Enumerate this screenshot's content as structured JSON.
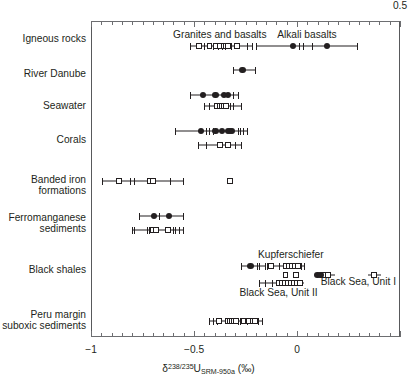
{
  "chart_data": {
    "type": "scatter",
    "title": "",
    "xlabel": "δ238/235U SRM-950a (‰)",
    "xlabel_parts": {
      "delta": "δ",
      "sup": "238/235",
      "element": "U",
      "sub": "SRM-950a",
      "units": "(‰)"
    },
    "ylabel": "",
    "xlim": [
      -1.0,
      0.5
    ],
    "xticks": [
      -1,
      -0.5,
      0,
      0.5
    ],
    "xticklabels": [
      "−1",
      "−0.5",
      "0",
      "0.5"
    ],
    "minor_tick_step": 0.05,
    "grid": false,
    "legend": "none",
    "marker_types": {
      "filled_circle": "measurement (filled circle)",
      "open_square": "measurement (open square)",
      "tick_cap": "individual sample tick"
    },
    "categories": [
      "Igneous rocks",
      "River Danube",
      "Seawater",
      "Corals",
      "Banded iron formations",
      "Ferromanganese sediments",
      "Black shales",
      "Peru margin suboxic sediments"
    ],
    "series": [
      {
        "name": "Igneous rocks — Granites and basalts",
        "category": "Igneous rocks",
        "marker": "open_square",
        "range": [
          -0.52,
          -0.22
        ],
        "squares": [
          -0.475,
          -0.425,
          -0.395,
          -0.375,
          -0.355,
          -0.345,
          -0.335,
          -0.29
        ],
        "ticks": [
          -0.52,
          -0.45,
          -0.41,
          -0.385,
          -0.365,
          -0.35,
          -0.32,
          -0.245,
          -0.22
        ]
      },
      {
        "name": "Igneous rocks — Alkali basalts",
        "category": "Igneous rocks",
        "marker": "filled_circle",
        "range": [
          -0.2,
          0.29
        ],
        "circles": [
          -0.02,
          0.145
        ],
        "ticks": [
          -0.2,
          0.01,
          0.03,
          0.075,
          0.29
        ]
      },
      {
        "name": "River Danube",
        "category": "River Danube",
        "marker": "filled_circle",
        "range": [
          -0.31,
          -0.205
        ],
        "circles": [
          -0.265
        ],
        "ticks": [
          -0.31,
          -0.205
        ]
      },
      {
        "name": "Seawater — filled",
        "category": "Seawater",
        "marker": "filled_circle",
        "range": [
          -0.52,
          -0.285
        ],
        "circles": [
          -0.455,
          -0.395,
          -0.355,
          -0.335
        ],
        "ticks": [
          -0.52,
          -0.31,
          -0.285
        ]
      },
      {
        "name": "Seawater — open",
        "category": "Seawater",
        "marker": "open_square",
        "range": [
          -0.45,
          -0.27
        ],
        "squares": [
          -0.39,
          -0.375,
          -0.365,
          -0.355,
          -0.345
        ],
        "ticks": [
          -0.45,
          -0.425,
          -0.325,
          -0.31,
          -0.27
        ]
      },
      {
        "name": "Corals — filled",
        "category": "Corals",
        "marker": "filled_circle",
        "range": [
          -0.59,
          -0.245
        ],
        "circles": [
          -0.465,
          -0.395,
          -0.365,
          -0.335,
          -0.325,
          -0.315
        ],
        "ticks": [
          -0.59,
          -0.44,
          -0.425,
          -0.41,
          -0.285,
          -0.275,
          -0.26,
          -0.245
        ]
      },
      {
        "name": "Corals — open",
        "category": "Corals",
        "marker": "open_square",
        "range": [
          -0.48,
          -0.27
        ],
        "squares": [
          -0.375,
          -0.335
        ],
        "ticks": [
          -0.48,
          -0.44,
          -0.3,
          -0.27
        ]
      },
      {
        "name": "Banded iron formations",
        "category": "Banded iron formations",
        "marker": "open_square",
        "range": [
          -0.945,
          -0.555
        ],
        "squares": [
          -0.865,
          -0.715,
          -0.7
        ],
        "ticks": [
          -0.945,
          -0.81,
          -0.79,
          -0.615,
          -0.555
        ],
        "outlier_squares": [
          -0.325
        ]
      },
      {
        "name": "Ferromanganese sediments — filled",
        "category": "Ferromanganese sediments",
        "marker": "filled_circle",
        "range": [
          -0.765,
          -0.555
        ],
        "circles": [
          -0.695,
          -0.62
        ],
        "ticks": [
          -0.765,
          -0.67,
          -0.555
        ]
      },
      {
        "name": "Ferromanganese sediments — open",
        "category": "Ferromanganese sediments",
        "marker": "open_square",
        "range": [
          -0.8,
          -0.555
        ],
        "squares": [
          -0.7,
          -0.685,
          -0.625
        ],
        "ticks": [
          -0.8,
          -0.79,
          -0.73,
          -0.72,
          -0.6,
          -0.59,
          -0.575,
          -0.555
        ]
      },
      {
        "name": "Black shales — filled",
        "category": "Black shales",
        "marker": "filled_circle",
        "range": [
          -0.27,
          -0.155
        ],
        "circles": [
          -0.225
        ],
        "ticks": [
          -0.27,
          -0.195,
          -0.185,
          -0.155
        ]
      },
      {
        "name": "Black shales — Kupferschiefer",
        "category": "Black shales",
        "marker": "open_square",
        "range": [
          -0.145,
          0.035
        ],
        "squares": [
          -0.125,
          -0.055,
          -0.04,
          -0.025,
          -0.01,
          0.005
        ],
        "ticks": [
          -0.145,
          -0.085,
          0.02,
          0.035
        ]
      },
      {
        "name": "Black shales — middle row",
        "category": "Black shales",
        "marker": "open_square",
        "squares": [
          -0.055,
          -0.005,
          0.125,
          0.15,
          0.375
        ],
        "circles": [
          0.1,
          0.115
        ],
        "segments": [
          [
            0.09,
            0.185
          ],
          [
            0.345,
            0.41
          ]
        ]
      },
      {
        "name": "Black shales — Black Sea Unit II",
        "category": "Black shales",
        "marker": "open_square",
        "range": [
          -0.185,
          0.035
        ],
        "squares": [
          -0.09,
          -0.075,
          -0.06,
          -0.045,
          -0.03,
          -0.015,
          0.0,
          0.015
        ],
        "ticks": [
          -0.185,
          -0.155,
          -0.12
        ]
      },
      {
        "name": "Peru margin suboxic sediments",
        "category": "Peru margin suboxic sediments",
        "marker": "open_square",
        "range": [
          -0.425,
          -0.17
        ],
        "squares": [
          -0.38,
          -0.335,
          -0.325,
          -0.315,
          -0.305,
          -0.295,
          -0.26,
          -0.235,
          -0.215,
          -0.205
        ],
        "ticks": [
          -0.425,
          -0.41,
          -0.39,
          -0.285,
          -0.275,
          -0.245,
          -0.19,
          -0.17
        ]
      }
    ],
    "annotations": [
      {
        "text": "Granites and basalts",
        "x": -0.375,
        "category": "Igneous rocks",
        "position": "above"
      },
      {
        "text": "Alkali basalts",
        "x": 0.045,
        "category": "Igneous rocks",
        "position": "above"
      },
      {
        "text": "Kupferschiefer",
        "x": -0.03,
        "category": "Black shales",
        "position": "above"
      },
      {
        "text": "Black Sea, Unit I",
        "x": 0.21,
        "category": "Black shales",
        "position": "right"
      },
      {
        "text": "Black Sea, Unit II",
        "x": -0.09,
        "category": "Black shales",
        "position": "below"
      }
    ]
  },
  "axis": {
    "ylabels": [
      "Igneous rocks",
      "River Danube",
      "Seawater",
      "Corals",
      "Banded iron\nformations",
      "Ferromanganese\nsediments",
      "Black shales",
      "Peru margin\nsuboxic sediments"
    ],
    "xticklabels": [
      "−1",
      "−0.5",
      "0",
      "0.5"
    ]
  },
  "colors": {
    "ink": "#231f20",
    "frame": "#6d6e71",
    "background": "#ffffff"
  }
}
